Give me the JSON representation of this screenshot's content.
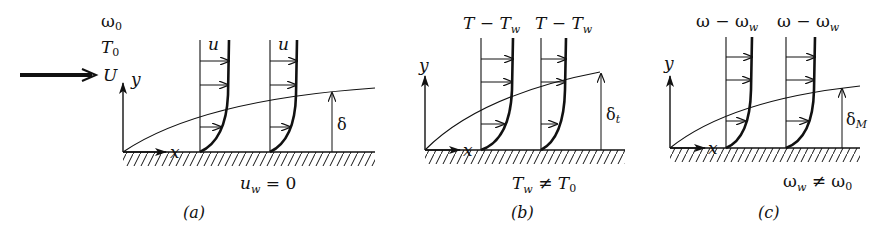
{
  "figure": {
    "panels": [
      {
        "id": "a",
        "caption": "(a)",
        "profile_label": "u",
        "boundary_layer_label": "δ",
        "boundary_layer_sub": "",
        "wall_condition": "u",
        "wall_condition_sub": "w",
        "wall_condition_rest": " = 0"
      },
      {
        "id": "b",
        "caption": "(b)",
        "profile_label": "T − T",
        "profile_label_sub": "w",
        "boundary_layer_label": "δ",
        "boundary_layer_sub": "t",
        "wall_condition": "T",
        "wall_condition_sub": "w",
        "wall_condition_rest": " ≠ T",
        "wall_condition_rest_sub": "0"
      },
      {
        "id": "c",
        "caption": "(c)",
        "profile_label": "ω − ω",
        "profile_label_sub": "w",
        "boundary_layer_label": "δ",
        "boundary_layer_sub": "M",
        "wall_condition": "ω",
        "wall_condition_sub": "w",
        "wall_condition_rest": " ≠ ω",
        "wall_condition_rest_sub": "0"
      }
    ],
    "freestream": {
      "omega": "ω",
      "omega_sub": "0",
      "temp": "T",
      "temp_sub": "0",
      "velocity": "U"
    },
    "axes": {
      "x": "x",
      "y": "y"
    },
    "colors": {
      "ink": "#111111",
      "background": "#ffffff"
    }
  }
}
